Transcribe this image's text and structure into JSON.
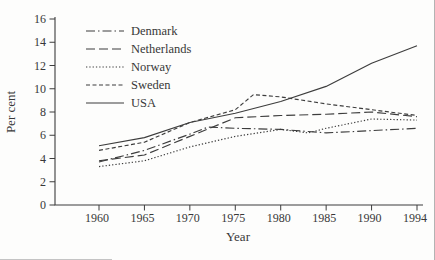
{
  "chart_data": {
    "type": "line",
    "title": "",
    "xlabel": "Year",
    "ylabel": "Per cent",
    "x_ticks": [
      1960,
      1965,
      1970,
      1975,
      1980,
      1985,
      1990,
      1994
    ],
    "y_ticks": [
      0,
      2,
      4,
      6,
      8,
      10,
      12,
      14,
      16
    ],
    "ylim": [
      0,
      16
    ],
    "grid": false,
    "legend_position": "upper-left",
    "line_color": "#3d3d3d",
    "text_color": "#383838",
    "series": [
      {
        "name": "Denmark",
        "linestyle": "dash-dot",
        "points": [
          [
            1960,
            3.7
          ],
          [
            1965,
            4.7
          ],
          [
            1970,
            6.1
          ],
          [
            1972,
            6.7
          ],
          [
            1975,
            6.6
          ],
          [
            1980,
            6.5
          ],
          [
            1985,
            6.2
          ],
          [
            1990,
            6.4
          ],
          [
            1994,
            6.6
          ]
        ]
      },
      {
        "name": "Netherlands",
        "linestyle": "long-dash",
        "points": [
          [
            1960,
            3.8
          ],
          [
            1965,
            4.3
          ],
          [
            1970,
            5.9
          ],
          [
            1975,
            7.5
          ],
          [
            1980,
            7.7
          ],
          [
            1985,
            7.8
          ],
          [
            1990,
            8.0
          ],
          [
            1994,
            7.6
          ]
        ]
      },
      {
        "name": "Norway",
        "linestyle": "dotted",
        "points": [
          [
            1960,
            3.3
          ],
          [
            1965,
            3.8
          ],
          [
            1970,
            5.0
          ],
          [
            1975,
            5.9
          ],
          [
            1980,
            6.5
          ],
          [
            1983,
            6.2
          ],
          [
            1985,
            6.6
          ],
          [
            1990,
            7.4
          ],
          [
            1994,
            7.3
          ]
        ]
      },
      {
        "name": "Sweden",
        "linestyle": "short-dash",
        "points": [
          [
            1960,
            4.7
          ],
          [
            1965,
            5.4
          ],
          [
            1970,
            7.1
          ],
          [
            1975,
            8.2
          ],
          [
            1977,
            9.5
          ],
          [
            1980,
            9.3
          ],
          [
            1985,
            8.7
          ],
          [
            1990,
            8.2
          ],
          [
            1994,
            7.7
          ]
        ]
      },
      {
        "name": "USA",
        "linestyle": "solid",
        "points": [
          [
            1960,
            5.1
          ],
          [
            1965,
            5.8
          ],
          [
            1970,
            7.1
          ],
          [
            1975,
            7.9
          ],
          [
            1980,
            8.9
          ],
          [
            1985,
            10.2
          ],
          [
            1990,
            12.2
          ],
          [
            1994,
            13.7
          ]
        ]
      }
    ]
  }
}
